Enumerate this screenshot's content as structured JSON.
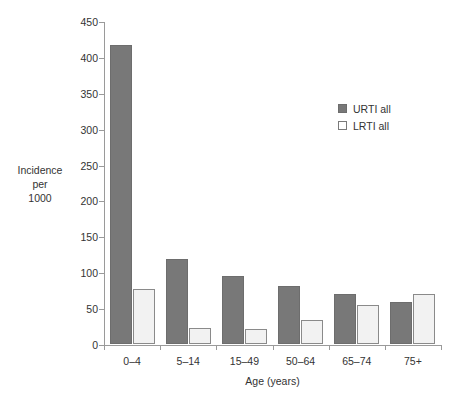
{
  "chart_data": {
    "type": "bar",
    "title": "",
    "subtitle": "",
    "xlabel": "Age (years)",
    "ylabel": "Incidence\nper\n1000",
    "categories": [
      "0–4",
      "5–14",
      "15–49",
      "50–64",
      "65–74",
      "75+"
    ],
    "series": [
      {
        "name": "URTI all",
        "values": [
          417,
          118,
          95,
          81,
          70,
          58
        ],
        "color": "#787878"
      },
      {
        "name": "LRTI all",
        "values": [
          77,
          23,
          21,
          34,
          55,
          69
        ],
        "color": "#f2f2f2"
      }
    ],
    "ylim": [
      0,
      450
    ],
    "ytick_step": 50,
    "yticks": [
      0,
      50,
      100,
      150,
      200,
      250,
      300,
      350,
      400,
      450
    ],
    "ytick_labels": [
      "0",
      "50",
      "100",
      "150",
      "200",
      "250",
      "300",
      "350",
      "400",
      "450"
    ],
    "grid": false,
    "legend_position": "top-right",
    "legend": [
      "URTI all",
      "LRTI all"
    ]
  },
  "axis": {
    "y_title_line1": "Incidence",
    "y_title_line2": "per",
    "y_title_line3": "1000",
    "x_title": "Age (years)"
  },
  "legend": {
    "items": [
      {
        "label": "URTI all"
      },
      {
        "label": "LRTI all"
      }
    ]
  }
}
